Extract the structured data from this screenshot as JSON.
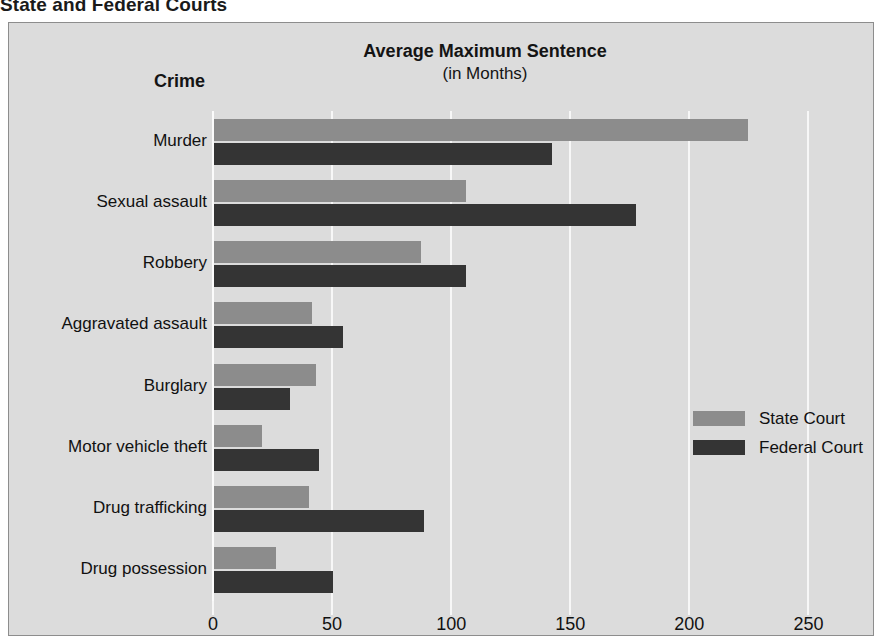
{
  "page_title": "State and Federal Courts",
  "header": {
    "crime_label": "Crime",
    "value_label_line1": "Average Maximum Sentence",
    "value_label_line2": "(in Months)"
  },
  "legend": {
    "position": "right-middle",
    "items": [
      {
        "label": "State Court",
        "color": "#8c8c8c"
      },
      {
        "label": "Federal Court",
        "color": "#343434"
      }
    ]
  },
  "colors": {
    "panel_background": "#dcdcdc",
    "gridline": "#f7f7f7",
    "state_court": "#8c8c8c",
    "federal_court": "#343434",
    "text": "#111111"
  },
  "chart_data": {
    "type": "bar",
    "orientation": "horizontal",
    "title": "Average Maximum Sentence",
    "subtitle": "(in Months)",
    "xlabel": "",
    "ylabel": "Crime",
    "xlim": [
      0,
      275
    ],
    "xticks": [
      0,
      50,
      100,
      150,
      200,
      250
    ],
    "xtick_labels": [
      "0",
      "50",
      "100",
      "150",
      "200",
      "250"
    ],
    "grid": true,
    "categories": [
      "Murder",
      "Sexual assault",
      "Robbery",
      "Aggravated assault",
      "Burglary",
      "Motor vehicle theft",
      "Drug trafficking",
      "Drug possession"
    ],
    "series": [
      {
        "name": "State Court",
        "color": "#8c8c8c",
        "values": [
          224,
          106,
          87,
          41,
          43,
          20,
          40,
          26
        ]
      },
      {
        "name": "Federal Court",
        "color": "#343434",
        "values": [
          142,
          177,
          106,
          54,
          32,
          44,
          88,
          50
        ]
      }
    ]
  }
}
